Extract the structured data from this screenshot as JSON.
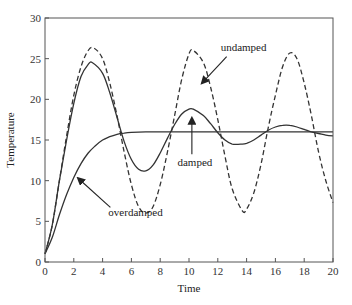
{
  "chart_data": {
    "type": "line",
    "title": "",
    "xlabel": "Time",
    "ylabel": "Temperature",
    "xlim": [
      0,
      20
    ],
    "ylim": [
      0,
      30
    ],
    "xticks": [
      0,
      2,
      4,
      6,
      8,
      10,
      12,
      14,
      16,
      18,
      20
    ],
    "yticks": [
      0,
      5,
      10,
      15,
      20,
      25,
      30
    ],
    "grid": false,
    "legend": "none (curves labeled by annotations)",
    "series": [
      {
        "name": "undamped",
        "style": "dashed",
        "x": [
          0,
          0.5,
          1,
          1.5,
          2,
          2.5,
          3,
          3.4,
          4,
          4.5,
          5,
          5.5,
          6,
          6.5,
          7,
          7.5,
          8,
          8.5,
          9,
          9.5,
          10,
          10.3,
          11,
          11.5,
          12,
          12.5,
          13,
          13.7,
          14,
          14.5,
          15,
          15.5,
          16,
          16.5,
          17,
          17.5,
          18,
          18.5,
          19,
          19.5,
          20
        ],
        "y": [
          1,
          4.5,
          10,
          15.5,
          20.5,
          24,
          26,
          26.3,
          25,
          22,
          18,
          13.5,
          9.5,
          6.8,
          6,
          6.8,
          9.5,
          13.5,
          18,
          22.5,
          25.6,
          26,
          24.5,
          21.5,
          17.5,
          13,
          9,
          6.3,
          6.5,
          8.5,
          12,
          16.5,
          20.5,
          24,
          25.7,
          25,
          22,
          18,
          13.5,
          10,
          7.3
        ]
      },
      {
        "name": "damped",
        "style": "solid",
        "x": [
          0,
          0.5,
          1,
          1.5,
          2,
          2.5,
          3,
          3.3,
          4,
          4.5,
          5,
          5.5,
          6,
          6.5,
          7,
          7.5,
          8,
          8.5,
          9,
          9.5,
          10,
          10.3,
          11,
          11.5,
          12,
          12.5,
          13,
          13.7,
          14,
          14.5,
          15,
          15.5,
          16,
          16.5,
          17,
          17.5,
          18,
          18.5,
          19,
          19.5,
          20
        ],
        "y": [
          1,
          4.5,
          10,
          15,
          19.5,
          22.8,
          24.3,
          24.5,
          23.2,
          20.8,
          17.8,
          14.8,
          12.6,
          11.4,
          11.2,
          11.9,
          13.4,
          15.2,
          16.9,
          18.2,
          18.8,
          18.8,
          18,
          17,
          15.9,
          15,
          14.5,
          14.5,
          14.6,
          15,
          15.6,
          16.2,
          16.6,
          16.8,
          16.8,
          16.6,
          16.3,
          16,
          15.8,
          15.6,
          15.5
        ]
      },
      {
        "name": "overdamped",
        "style": "solid",
        "x": [
          0,
          0.5,
          1,
          1.5,
          2,
          2.5,
          3,
          3.5,
          4,
          4.5,
          5,
          5.5,
          6,
          7,
          8,
          10,
          12,
          14,
          16,
          18,
          20
        ],
        "y": [
          1,
          3,
          5.8,
          8.3,
          10.4,
          12.1,
          13.4,
          14.3,
          15,
          15.4,
          15.7,
          15.85,
          15.95,
          16,
          16,
          16,
          16,
          16,
          16,
          16,
          16
        ]
      }
    ],
    "annotations": [
      {
        "text": "undamped",
        "text_at": [
          12.2,
          26
        ],
        "arrow_to": [
          10.9,
          22
        ]
      },
      {
        "text": "damped",
        "text_at": [
          9.2,
          13.5
        ],
        "arrow_to": [
          10.2,
          17.7
        ]
      },
      {
        "text": "overdamped",
        "text_at": [
          4.4,
          5.6
        ],
        "arrow_to": [
          2.3,
          10.3
        ]
      }
    ]
  }
}
